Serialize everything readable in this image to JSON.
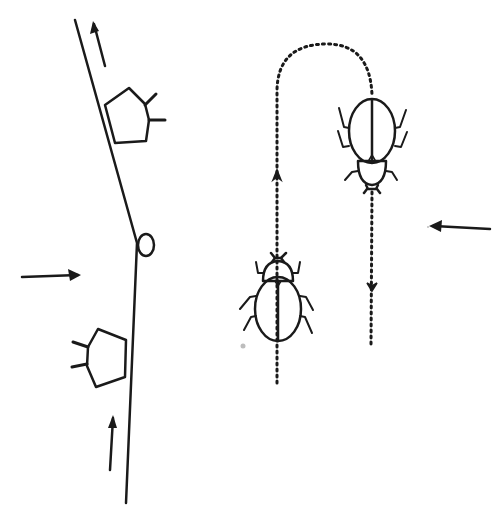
{
  "figure": {
    "colors": {
      "ink": "#1a1a1a",
      "background": "#ffffff"
    },
    "left_panel": {
      "elements": [
        "slanted-line",
        "upper-pentagon-beetle",
        "small-oval",
        "lower-pentagon-beetle",
        "arrow-up-top",
        "arrow-right-middle",
        "arrow-up-bottom"
      ]
    },
    "right_panel": {
      "elements": [
        "dotted-u-path",
        "beetle-bottom-facing-up",
        "beetle-top-facing-down",
        "path-arrow-up",
        "path-arrow-down",
        "arrow-left"
      ]
    }
  }
}
